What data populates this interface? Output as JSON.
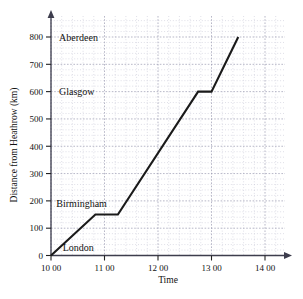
{
  "chart_data": {
    "type": "line",
    "title": "",
    "xlabel": "Time",
    "ylabel": "Distance from Heathrow (km)",
    "xlim": [
      10,
      14.45
    ],
    "ylim": [
      0,
      860
    ],
    "grid": true,
    "legend": "none",
    "x_tick_labels": [
      "10 00",
      "11 00",
      "12 00",
      "13 00",
      "14 00"
    ],
    "x_tick_values": [
      10,
      11,
      12,
      13,
      14
    ],
    "y_tick_labels": [
      "0",
      "100",
      "200",
      "300",
      "400",
      "500",
      "600",
      "700",
      "800"
    ],
    "y_tick_values": [
      0,
      100,
      200,
      300,
      400,
      500,
      600,
      700,
      800
    ],
    "series": [
      {
        "name": "journey",
        "x": [
          10.0,
          10.83,
          11.25,
          12.75,
          13.0,
          13.5
        ],
        "y": [
          0,
          150,
          150,
          600,
          600,
          800
        ]
      }
    ],
    "annotations": [
      {
        "text": "Aberdeen",
        "x": 10.15,
        "y": 800
      },
      {
        "text": "Glasgow",
        "x": 10.15,
        "y": 600
      },
      {
        "text": "Birmingham",
        "x": 10.1,
        "y": 190
      },
      {
        "text": "London",
        "x": 10.22,
        "y": 30
      }
    ]
  },
  "style": {
    "line_color": "#1a1a1a",
    "axis_color": "#3d3d4d",
    "grid_minor_color": "#c9c9d6",
    "grid_major_color": "#9a9ab0",
    "background": "#ffffff"
  }
}
